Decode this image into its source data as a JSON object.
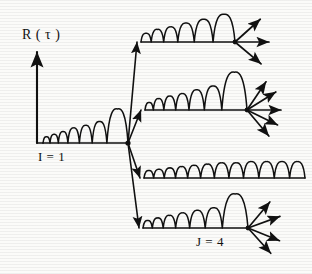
{
  "figure": {
    "title_label": "R ( τ )",
    "ink_color": "#111111",
    "background_color": "#fbfbf9",
    "width": 312,
    "height": 274
  },
  "axis": {
    "vertical_label": "R ( τ )",
    "vertical_x": 37,
    "vertical_top": 52,
    "vertical_bottom": 143,
    "arrowhead": "up"
  },
  "labels": {
    "trunk_label": "I = 1",
    "branch_label": "J = 4"
  },
  "chart_data": {
    "type": "line",
    "title": "R ( τ )",
    "xlabel": "",
    "ylabel": "R ( τ )",
    "branch_node": {
      "x": 128,
      "y": 143
    },
    "trunk": {
      "name": "I = 1",
      "baseline_y": 143,
      "x_start": 37,
      "x_end": 128,
      "bump_count": 7,
      "bump_amplitudes": [
        5,
        7,
        9,
        12,
        14,
        17,
        27
      ],
      "terminal_arrows": 0
    },
    "branches": [
      {
        "name": "branch-1",
        "baseline_y": 42,
        "x_start": 137,
        "x_end": 235,
        "diagonal_from": {
          "x": 128,
          "y": 143
        },
        "diagonal_to": {
          "x": 137,
          "y": 42
        },
        "bump_count": 6,
        "bump_amplitudes": [
          7,
          10,
          12,
          15,
          18,
          22
        ],
        "terminal_node": {
          "x": 235,
          "y": 42
        },
        "terminal_arrows": 3,
        "arrow_angles_deg": [
          -42,
          0,
          40
        ]
      },
      {
        "name": "branch-2",
        "baseline_y": 110,
        "x_start": 141,
        "x_end": 247,
        "diagonal_from": {
          "x": 128,
          "y": 143
        },
        "diagonal_to": {
          "x": 141,
          "y": 110
        },
        "bump_count": 7,
        "bump_amplitudes": [
          6,
          9,
          11,
          13,
          16,
          19,
          30
        ],
        "terminal_node": {
          "x": 247,
          "y": 110
        },
        "terminal_arrows": 5,
        "arrow_angles_deg": [
          -56,
          -32,
          0,
          26,
          50
        ]
      },
      {
        "name": "branch-3",
        "baseline_y": 178,
        "x_start": 140,
        "x_end": 305,
        "diagonal_from": {
          "x": 128,
          "y": 143
        },
        "diagonal_to": {
          "x": 140,
          "y": 178
        },
        "bump_count": 12,
        "bump_amplitudes": [
          6,
          7,
          8,
          9,
          10,
          11,
          12,
          12,
          13,
          13,
          13,
          13
        ],
        "terminal_node": null,
        "terminal_arrows": 0,
        "arrow_angles_deg": []
      },
      {
        "name": "branch-4",
        "baseline_y": 228,
        "x_start": 139,
        "x_end": 248,
        "diagonal_from": {
          "x": 128,
          "y": 143
        },
        "diagonal_to": {
          "x": 139,
          "y": 228
        },
        "bump_count": 7,
        "bump_amplitudes": [
          6,
          8,
          10,
          12,
          14,
          16,
          27
        ],
        "terminal_node": {
          "x": 248,
          "y": 228
        },
        "terminal_arrows": 4,
        "arrow_angles_deg": [
          -50,
          -20,
          22,
          48
        ]
      }
    ],
    "annotations": [
      {
        "text": "I = 1",
        "x": 38,
        "y": 156
      },
      {
        "text": "J = 4",
        "x": 196,
        "y": 241
      },
      {
        "text": "R ( τ )",
        "x": 22,
        "y": 38
      }
    ],
    "grid": false,
    "legend": null
  }
}
